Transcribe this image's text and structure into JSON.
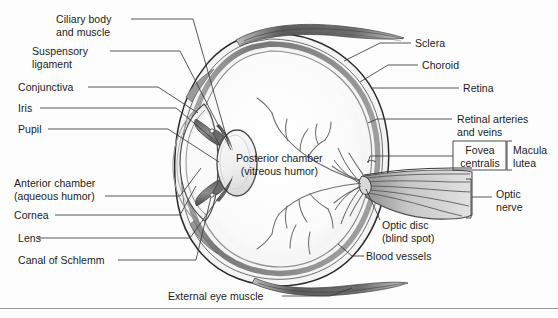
{
  "figure": {
    "style": "grayscale-line-drawing",
    "colors": {
      "ink": "#1b1b1b",
      "leader_line": "#3a3a3a",
      "sclera_fill": "#f2f2f2",
      "choroid_fill": "#8a8a8a",
      "vitreous_fill": "#fbfbfb",
      "lens_fill": "#f0f0f0",
      "muscle_fill": "#6e6e6e",
      "background": "#fdfdfd"
    },
    "footer_rule": true
  },
  "labels": {
    "ciliary_body": "Ciliary body\nand muscle",
    "suspensory_ligament": "Suspensory\nligament",
    "conjunctiva": "Conjunctiva",
    "iris": "Iris",
    "pupil": "Pupil",
    "anterior_chamber": "Anterior chamber\n(aqueous humor)",
    "cornea": "Cornea",
    "lens": "Lens",
    "canal_of_schlemm": "Canal of Schlemm",
    "external_eye_muscle": "External eye muscle",
    "posterior_chamber": "Posterior chamber\n(vitreous humor)",
    "sclera": "Sclera",
    "choroid": "Choroid",
    "retina": "Retina",
    "retinal_vessels": "Retinal arteries\nand veins",
    "fovea_centralis": "Fovea\ncentralis",
    "macula_lutea": "Macula\nlutea",
    "optic_nerve": "Optic\nnerve",
    "optic_disc": "Optic disc\n(blind spot)",
    "blood_vessels": "Blood vessels"
  }
}
